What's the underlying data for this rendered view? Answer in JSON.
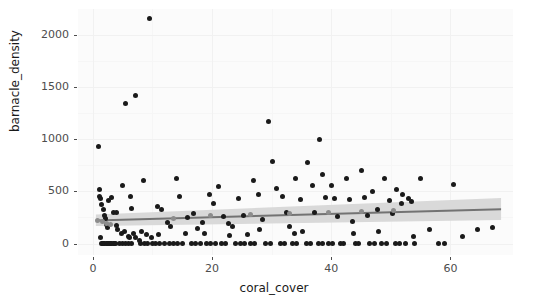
{
  "chart_data": {
    "type": "scatter",
    "title": "",
    "xlabel": "coral_cover",
    "ylabel": "barnacle_density",
    "xlim": [
      -2.5,
      70.5
    ],
    "ylim": [
      -110,
      2250
    ],
    "xticks": [
      0,
      20,
      40,
      60
    ],
    "xtick_labels": [
      "0",
      "20",
      "40",
      "60"
    ],
    "yticks": [
      0,
      500,
      1000,
      1500,
      2000
    ],
    "ytick_labels": [
      "0",
      "500",
      "1000",
      "1500",
      "2000"
    ],
    "grid": true,
    "legend": "none",
    "point_color": "#1a1a1a",
    "fit_line_color": "#737373",
    "ribbon_color": "#d9d9d9",
    "panel_background": "#fbfbfb",
    "series": [
      {
        "name": "observations",
        "marker": "filled-circle",
        "points": [
          [
            1.0,
            930
          ],
          [
            1.2,
            60
          ],
          [
            1.4,
            0
          ],
          [
            1.6,
            0
          ],
          [
            1.8,
            0
          ],
          [
            2.0,
            0
          ],
          [
            2.2,
            0
          ],
          [
            2.4,
            0
          ],
          [
            2.6,
            0
          ],
          [
            2.8,
            0
          ],
          [
            3.0,
            0
          ],
          [
            3.2,
            0
          ],
          [
            3.4,
            0
          ],
          [
            3.6,
            0
          ],
          [
            3.8,
            0
          ],
          [
            1.1,
            455
          ],
          [
            1.3,
            430
          ],
          [
            1.5,
            370
          ],
          [
            1.7,
            330
          ],
          [
            1.9,
            265
          ],
          [
            2.1,
            245
          ],
          [
            2.3,
            185
          ],
          [
            2.5,
            150
          ],
          [
            1.05,
            520
          ],
          [
            2.7,
            415
          ],
          [
            3.1,
            440
          ],
          [
            3.5,
            300
          ],
          [
            3.9,
            170
          ],
          [
            4.5,
            0
          ],
          [
            5.0,
            0
          ],
          [
            5.5,
            0
          ],
          [
            6.0,
            0
          ],
          [
            6.5,
            0
          ],
          [
            4.2,
            130
          ],
          [
            4.8,
            95
          ],
          [
            5.3,
            115
          ],
          [
            5.9,
            70
          ],
          [
            6.2,
            60
          ],
          [
            6.8,
            100
          ],
          [
            7.2,
            55
          ],
          [
            7.8,
            30
          ],
          [
            5.5,
            1340
          ],
          [
            7.2,
            1420
          ],
          [
            9.5,
            2160
          ],
          [
            5.0,
            555
          ],
          [
            8.5,
            600
          ],
          [
            6.3,
            455
          ],
          [
            8.0,
            0
          ],
          [
            8.6,
            0
          ],
          [
            9.2,
            0
          ],
          [
            10.0,
            0
          ],
          [
            8.2,
            120
          ],
          [
            9.0,
            90
          ],
          [
            9.8,
            60
          ],
          [
            10.5,
            0
          ],
          [
            11.2,
            0
          ],
          [
            12.0,
            0
          ],
          [
            12.8,
            0
          ],
          [
            10.8,
            360
          ],
          [
            11.5,
            330
          ],
          [
            12.5,
            205
          ],
          [
            13.5,
            0
          ],
          [
            14.2,
            0
          ],
          [
            15.0,
            0
          ],
          [
            14.0,
            620
          ],
          [
            14.6,
            455
          ],
          [
            15.5,
            95
          ],
          [
            16.5,
            0
          ],
          [
            17.2,
            0
          ],
          [
            18.0,
            0
          ],
          [
            16.8,
            290
          ],
          [
            17.5,
            145
          ],
          [
            18.4,
            205
          ],
          [
            19.0,
            0
          ],
          [
            19.8,
            0
          ],
          [
            20.5,
            0
          ],
          [
            19.5,
            470
          ],
          [
            20.2,
            380
          ],
          [
            21.0,
            545
          ],
          [
            21.5,
            0
          ],
          [
            22.2,
            0
          ],
          [
            22.0,
            255
          ],
          [
            22.8,
            190
          ],
          [
            23.5,
            160
          ],
          [
            24.0,
            0
          ],
          [
            24.8,
            0
          ],
          [
            25.5,
            0
          ],
          [
            24.5,
            430
          ],
          [
            25.2,
            265
          ],
          [
            26.0,
            90
          ],
          [
            26.5,
            0
          ],
          [
            27.2,
            0
          ],
          [
            27.0,
            600
          ],
          [
            27.8,
            475
          ],
          [
            28.5,
            230
          ],
          [
            29.0,
            0
          ],
          [
            29.8,
            0
          ],
          [
            29.5,
            1170
          ],
          [
            30.2,
            790
          ],
          [
            30.8,
            530
          ],
          [
            31.5,
            0
          ],
          [
            32.2,
            0
          ],
          [
            31.8,
            455
          ],
          [
            32.5,
            300
          ],
          [
            33.0,
            160
          ],
          [
            33.5,
            0
          ],
          [
            34.2,
            0
          ],
          [
            34.0,
            620
          ],
          [
            34.8,
            420
          ],
          [
            35.2,
            115
          ],
          [
            35.8,
            0
          ],
          [
            36.5,
            0
          ],
          [
            36.0,
            780
          ],
          [
            36.8,
            560
          ],
          [
            37.2,
            300
          ],
          [
            37.8,
            0
          ],
          [
            38.5,
            0
          ],
          [
            38.0,
            1000
          ],
          [
            38.6,
            660
          ],
          [
            39.0,
            440
          ],
          [
            39.5,
            0
          ],
          [
            40.2,
            0
          ],
          [
            40.0,
            560
          ],
          [
            40.6,
            430
          ],
          [
            41.0,
            255
          ],
          [
            41.5,
            0
          ],
          [
            42.0,
            0
          ],
          [
            42.5,
            625
          ],
          [
            43.0,
            420
          ],
          [
            43.5,
            210
          ],
          [
            44.0,
            0
          ],
          [
            44.5,
            0
          ],
          [
            45.0,
            700
          ],
          [
            45.5,
            445
          ],
          [
            46.0,
            265
          ],
          [
            46.5,
            0
          ],
          [
            47.2,
            0
          ],
          [
            47.0,
            500
          ],
          [
            47.8,
            330
          ],
          [
            48.5,
            0
          ],
          [
            49.2,
            0
          ],
          [
            49.0,
            620
          ],
          [
            49.8,
            415
          ],
          [
            50.2,
            290
          ],
          [
            50.8,
            0
          ],
          [
            51.5,
            0
          ],
          [
            51.0,
            520
          ],
          [
            51.8,
            380
          ],
          [
            52.5,
            0
          ],
          [
            52.0,
            470
          ],
          [
            53.0,
            430
          ],
          [
            53.5,
            405
          ],
          [
            54.0,
            0
          ],
          [
            55.0,
            620
          ],
          [
            56.5,
            135
          ],
          [
            58.0,
            0
          ],
          [
            59.0,
            0
          ],
          [
            60.5,
            570
          ],
          [
            62.0,
            70
          ],
          [
            64.5,
            135
          ],
          [
            67.0,
            155
          ],
          [
            4.0,
            300
          ],
          [
            6.5,
            340
          ],
          [
            11.0,
            90
          ],
          [
            13.0,
            165
          ],
          [
            15.8,
            250
          ],
          [
            18.8,
            95
          ],
          [
            23.0,
            80
          ],
          [
            28.0,
            135
          ],
          [
            33.8,
            95
          ],
          [
            43.8,
            95
          ],
          [
            48.0,
            120
          ],
          [
            53.8,
            70
          ]
        ]
      },
      {
        "name": "fit-markers",
        "marker": "filled-circle-grey",
        "points": [
          [
            0.8,
            225
          ],
          [
            1.6,
            215
          ],
          [
            2.2,
            195
          ],
          [
            2.9,
            180
          ],
          [
            13.5,
            245
          ],
          [
            19.8,
            265
          ],
          [
            26.5,
            275
          ],
          [
            33.0,
            285
          ],
          [
            39.5,
            295
          ],
          [
            45.0,
            305
          ],
          [
            50.5,
            315
          ]
        ]
      }
    ],
    "fit": {
      "name": "linear-smooth",
      "x_start": 0.5,
      "x_end": 68.5,
      "y_start": 222,
      "y_end": 330,
      "ci_lower_start": 168,
      "ci_lower_end": 225,
      "ci_upper_start": 278,
      "ci_upper_end": 437
    }
  }
}
